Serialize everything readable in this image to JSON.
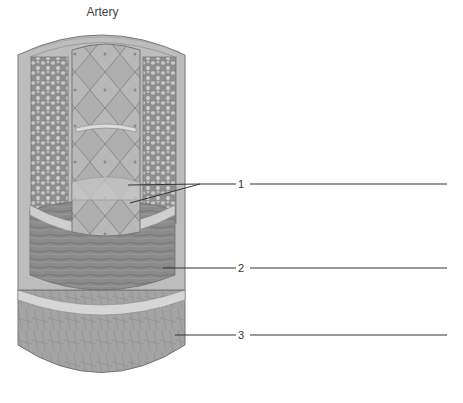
{
  "title": "Artery",
  "labels": [
    {
      "number": "1",
      "answer": "",
      "y": 184
    },
    {
      "number": "2",
      "answer": "",
      "y": 268
    },
    {
      "number": "3",
      "answer": "",
      "y": 335
    }
  ],
  "colors": {
    "background": "#ffffff",
    "outer_layer": "#b5b5b5",
    "cellular_layer": "#9a9a9a",
    "lumen_cells": "#a9a9a9",
    "muscle": "#8c8c8c",
    "adventitia": "#a3a3a3",
    "leader_line": "#333333"
  }
}
